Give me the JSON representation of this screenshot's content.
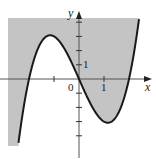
{
  "figure": {
    "x_axis_label": "x",
    "y_axis_label": "y",
    "origin_label": "0",
    "x_tick_label": "1",
    "y_tick_label": "1",
    "shade_color": "#c4c4c4",
    "curve_color": "#1a1a1a",
    "axis_color": "#444444"
  },
  "chart_data": {
    "type": "region",
    "curve": "y = x^3 - 4x",
    "shaded": "y >= x^3 - 4x",
    "x_range": [
      -3.1,
      2.9
    ],
    "y_range": [
      -5.0,
      4.4
    ],
    "roots": [
      -2,
      0,
      2
    ],
    "local_max": [
      -1.155,
      3.08
    ],
    "local_min": [
      1.155,
      -3.08
    ],
    "x_ticks": [
      -1,
      1
    ],
    "y_ticks": [
      -4,
      -3,
      -2,
      -1,
      1,
      2,
      3,
      4
    ],
    "labeled_ticks": {
      "x": 1,
      "y": 1
    }
  }
}
